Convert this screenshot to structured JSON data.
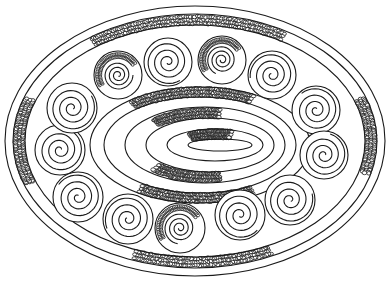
{
  "image": {
    "description": "Black line-art drawing of an oval ornamental plate with a ring of spiral circles around a concentric oval center and cobblestone-textured bands",
    "background": "#ffffff",
    "stroke": "#1a1a1a",
    "width": 390,
    "height": 283
  },
  "outer_ovals": [
    {
      "cx": 195,
      "cy": 141,
      "rx": 190,
      "ry": 135
    },
    {
      "cx": 195,
      "cy": 141,
      "rx": 182,
      "ry": 127
    },
    {
      "cx": 195,
      "cy": 141,
      "rx": 170,
      "ry": 116
    }
  ],
  "inner_ovals": [
    {
      "cx": 200,
      "cy": 145,
      "rx": 110,
      "ry": 58
    },
    {
      "cx": 200,
      "cy": 145,
      "rx": 96,
      "ry": 48
    },
    {
      "cx": 205,
      "cy": 145,
      "rx": 80,
      "ry": 38
    },
    {
      "cx": 210,
      "cy": 145,
      "rx": 64,
      "ry": 27
    },
    {
      "cx": 215,
      "cy": 145,
      "rx": 48,
      "ry": 16
    },
    {
      "cx": 220,
      "cy": 145,
      "rx": 32,
      "ry": 6
    }
  ],
  "spirals": [
    {
      "cx": 118,
      "cy": 75,
      "r": 24,
      "cobble": true
    },
    {
      "cx": 168,
      "cy": 62,
      "r": 24,
      "cobble": false
    },
    {
      "cx": 222,
      "cy": 60,
      "r": 24,
      "cobble": true
    },
    {
      "cx": 272,
      "cy": 75,
      "r": 24,
      "cobble": false
    },
    {
      "cx": 316,
      "cy": 110,
      "r": 24,
      "cobble": false
    },
    {
      "cx": 324,
      "cy": 155,
      "r": 24,
      "cobble": false
    },
    {
      "cx": 290,
      "cy": 200,
      "r": 25,
      "cobble": false
    },
    {
      "cx": 240,
      "cy": 215,
      "r": 25,
      "cobble": false
    },
    {
      "cx": 180,
      "cy": 228,
      "r": 25,
      "cobble": true
    },
    {
      "cx": 128,
      "cy": 219,
      "r": 25,
      "cobble": false
    },
    {
      "cx": 78,
      "cy": 197,
      "r": 25,
      "cobble": false
    },
    {
      "cx": 60,
      "cy": 150,
      "r": 25,
      "cobble": false
    },
    {
      "cx": 72,
      "cy": 108,
      "r": 25,
      "cobble": false
    }
  ],
  "cobble_bands": [
    {
      "name": "top-outer",
      "cx": 195,
      "cy": 141,
      "rx": 176,
      "ry": 121,
      "a0": 235,
      "a1": 300
    },
    {
      "name": "bottom-outer",
      "cx": 195,
      "cy": 141,
      "rx": 176,
      "ry": 121,
      "a0": 65,
      "a1": 110
    },
    {
      "name": "left-outer",
      "cx": 195,
      "cy": 141,
      "rx": 176,
      "ry": 121,
      "a0": 160,
      "a1": 200
    },
    {
      "name": "right-outer",
      "cx": 195,
      "cy": 141,
      "rx": 176,
      "ry": 121,
      "a0": 340,
      "a1": 375
    },
    {
      "name": "inner-top",
      "cx": 200,
      "cy": 145,
      "rx": 103,
      "ry": 53,
      "a0": 230,
      "a1": 300
    },
    {
      "name": "inner-bottom",
      "cx": 200,
      "cy": 145,
      "rx": 103,
      "ry": 53,
      "a0": 60,
      "a1": 125
    },
    {
      "name": "mid-top",
      "cx": 207,
      "cy": 145,
      "rx": 72,
      "ry": 32,
      "a0": 225,
      "a1": 280
    },
    {
      "name": "mid-bottom",
      "cx": 207,
      "cy": 145,
      "rx": 72,
      "ry": 32,
      "a0": 80,
      "a1": 135
    },
    {
      "name": "core",
      "cx": 217,
      "cy": 145,
      "rx": 40,
      "ry": 11,
      "a0": 230,
      "a1": 290
    }
  ]
}
